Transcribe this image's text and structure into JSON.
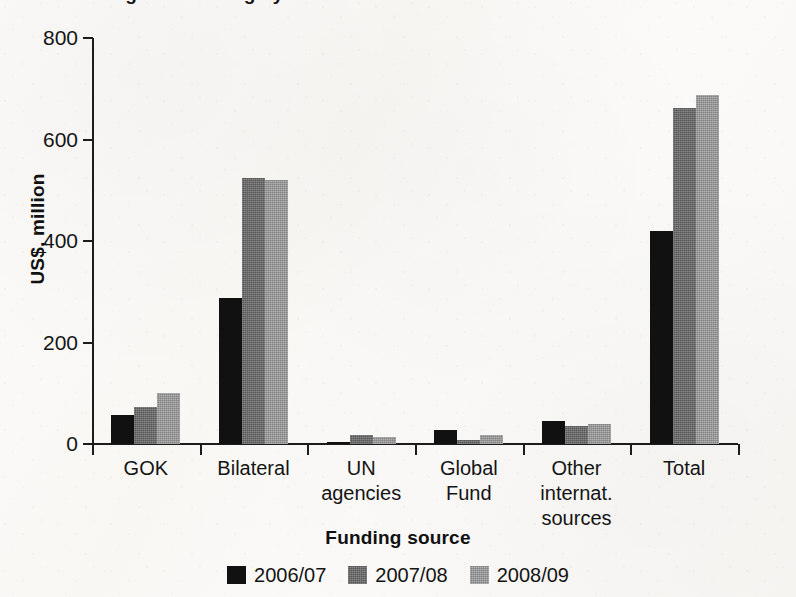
{
  "title": {
    "text": "Figure: Funding by source",
    "visible": "cropped"
  },
  "axes": {
    "ylabel": "US$, million",
    "xlabel": "Funding source",
    "yticks": [
      "800",
      "600",
      "400",
      "200",
      "0"
    ]
  },
  "legend": {
    "items": [
      {
        "label": "2006/07",
        "color": "#111111",
        "swatch_name": "legend-swatch-2006-07"
      },
      {
        "label": "2007/08",
        "color": "#6b6b6b",
        "swatch_name": "legend-swatch-2007-08"
      },
      {
        "label": "2008/09",
        "color": "#9c9c9c",
        "swatch_name": "legend-swatch-2008-09"
      }
    ]
  },
  "chart_data": {
    "type": "bar",
    "title": "Funding by source",
    "xlabel": "Funding source",
    "ylabel": "US$, million",
    "ylim": [
      0,
      800
    ],
    "yticks": [
      0,
      200,
      400,
      600,
      800
    ],
    "grid": false,
    "legend_position": "bottom-center",
    "categories": [
      "GOK",
      "Bilateral",
      "UN agencies",
      "Global Fund",
      "Other internat. sources",
      "Total"
    ],
    "category_lines": [
      [
        "GOK"
      ],
      [
        "Bilateral"
      ],
      [
        "UN",
        "agencies"
      ],
      [
        "Global",
        "Fund"
      ],
      [
        "Other",
        "internat.",
        "sources"
      ],
      [
        "Total"
      ]
    ],
    "series": [
      {
        "name": "2006/07",
        "color": "#111111",
        "values": [
          58,
          287,
          4,
          28,
          45,
          420
        ]
      },
      {
        "name": "2007/08",
        "color": "#6b6b6b",
        "values": [
          73,
          525,
          18,
          8,
          36,
          662
        ]
      },
      {
        "name": "2008/09",
        "color": "#9c9c9c",
        "values": [
          100,
          520,
          14,
          18,
          40,
          688
        ]
      }
    ]
  }
}
